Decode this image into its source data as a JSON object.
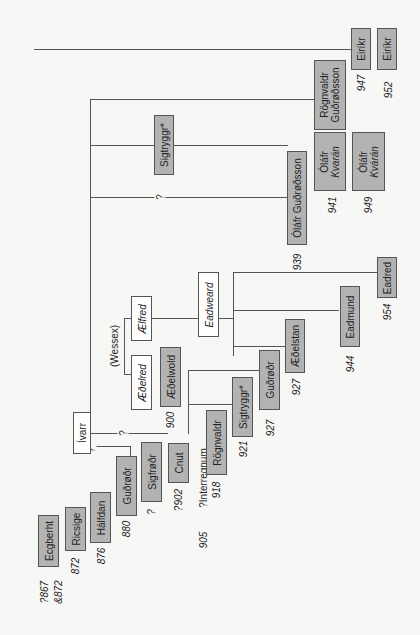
{
  "diagram": {
    "type": "genealogy-tree",
    "orientation": "rotated-90-ccw",
    "root": {
      "name": "Ívarr"
    },
    "wessex_label": "(Wessex)",
    "uncertain_marker": "?",
    "interregnum_label": "?Interregnum",
    "persons": {
      "ecgberht": {
        "name": "Ecgberht",
        "date": "?867\n&872",
        "date_a": "?867",
        "date_b": "&872"
      },
      "ricsige": {
        "name": "Ricsige",
        "date": "872"
      },
      "halfdan": {
        "name": "Hálfdan",
        "date": "876"
      },
      "gudrodr1": {
        "name": "Guðrøðr",
        "date": "880"
      },
      "sigfrodr": {
        "name": "Sigfrøðr",
        "date": "?"
      },
      "cnut": {
        "name": "Cnut",
        "date": "?902"
      },
      "interregnum": {
        "date": "905"
      },
      "aedelred": {
        "name": "Æðelred"
      },
      "aelfred": {
        "name": "Ælfred"
      },
      "aedelwold": {
        "name": "Æðelwold",
        "date": "900"
      },
      "eadweard": {
        "name": "Eadweard"
      },
      "rognvaldr": {
        "name": "Rögnvaldr",
        "date": "918"
      },
      "sigtryggr1": {
        "name": "Sigtryggr*",
        "date": "921"
      },
      "gudrodr2": {
        "name": "Guðrøðr",
        "date": "927"
      },
      "aedelstan": {
        "name": "Æðelstan",
        "date": "927"
      },
      "eadmund": {
        "name": "Eadmund",
        "date": "944"
      },
      "eadred": {
        "name": "Eadred",
        "date": "954"
      },
      "sigtryggr2": {
        "name": "Sigtryggr*"
      },
      "olafr_gudrodsson": {
        "name": "Óláfr Guðrøðsson",
        "date": "939"
      },
      "olafr_kvaran1": {
        "name": "Óláfr",
        "name2": "Kvarán",
        "date": "941"
      },
      "olafr_kvaran2": {
        "name": "Óláfr",
        "name2": "Kvárán",
        "date": "949"
      },
      "rognvaldr_gudrodsson": {
        "name": "Rögnvaldr",
        "name2": "Guðrøðsson"
      },
      "eirikr1": {
        "name": "Eiríkr",
        "date": "947"
      },
      "eirikr2": {
        "name": "Eiríkr",
        "date": "952"
      }
    },
    "colors": {
      "ruler_box": "#b3b3b3",
      "non_ruler_box": "#ffffff",
      "line": "#555555",
      "background": "#f7f7f5"
    }
  }
}
